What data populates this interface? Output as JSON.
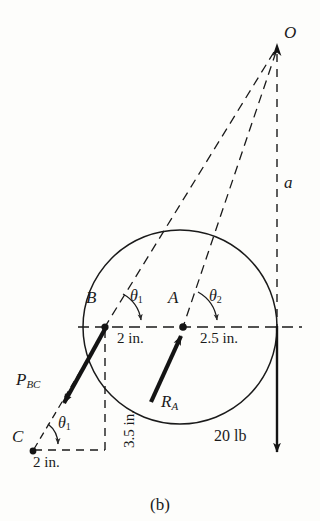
{
  "figure": {
    "caption": "(b)",
    "type": "free-body-diagram",
    "background_color": "#fdfdfb",
    "line_color": "#1a1a1a"
  },
  "points": [
    {
      "id": "O",
      "label": "O",
      "x": 277,
      "y": 45,
      "label_x": 285,
      "label_y": 33
    },
    {
      "id": "A",
      "label": "A",
      "x": 183,
      "y": 327,
      "label_x": 170,
      "label_y": 300
    },
    {
      "id": "B",
      "label": "B",
      "x": 105,
      "y": 327,
      "label_x": 88,
      "label_y": 300
    },
    {
      "id": "C",
      "label": "C",
      "x": 32,
      "y": 450,
      "label_x": 14,
      "label_y": 430
    }
  ],
  "circle": {
    "center_x": 180,
    "center_y": 327,
    "radius": 97
  },
  "angles": [
    {
      "id": "theta1_top",
      "label": "θ",
      "sub": "1",
      "label_x": 132,
      "label_y": 291
    },
    {
      "id": "theta2_top",
      "label": "θ",
      "sub": "2",
      "label_x": 210,
      "label_y": 291
    },
    {
      "id": "theta1_bottom",
      "label": "θ",
      "sub": "1",
      "label_x": 60,
      "label_y": 419
    }
  ],
  "dimensions": [
    {
      "id": "dim-ab",
      "label": "2 in.",
      "x": 124,
      "y": 334,
      "rotated": false
    },
    {
      "id": "dim-a-right",
      "label": "2.5 in.",
      "x": 204,
      "y": 334,
      "rotated": false
    },
    {
      "id": "dim-bc-vert",
      "label": "3.5 in.",
      "x": 118,
      "y": 440,
      "rotated": true
    },
    {
      "id": "dim-bottom",
      "label": "2 in.",
      "x": 36,
      "y": 456,
      "rotated": false
    }
  ],
  "forces": [
    {
      "id": "P_BC",
      "label": "P",
      "sub": "BC",
      "label_x": 18,
      "label_y": 372,
      "value": null
    },
    {
      "id": "R_A",
      "label": "R",
      "sub": "A",
      "label_x": 163,
      "label_y": 396,
      "value": null
    },
    {
      "id": "W",
      "label": "20 lb",
      "sub": "",
      "label_x": 216,
      "label_y": 435,
      "value": "20 lb"
    }
  ],
  "distances": [
    {
      "id": "a",
      "label": "a",
      "label_x": 285,
      "label_y": 178
    }
  ],
  "lines": {
    "centerline": {
      "x1": 80,
      "y1": 327,
      "x2": 300,
      "y2": 327,
      "style": "dashed"
    },
    "vertical_from_O": {
      "x1": 277,
      "y1": 52,
      "x2": 277,
      "y2": 327,
      "style": "dashed"
    },
    "O_to_B": {
      "x1": 277,
      "y1": 50,
      "x2": 105,
      "y2": 327,
      "style": "dashed"
    },
    "O_to_A": {
      "x1": 277,
      "y1": 50,
      "x2": 183,
      "y2": 327,
      "style": "dashed"
    },
    "B_vertical_drop": {
      "x1": 105,
      "y1": 327,
      "x2": 105,
      "y2": 450,
      "style": "dashed"
    },
    "C_horizontal": {
      "x1": 32,
      "y1": 450,
      "x2": 105,
      "y2": 450,
      "style": "dashed"
    },
    "C_to_B_line": {
      "x1": 32,
      "y1": 450,
      "x2": 105,
      "y2": 327,
      "style": "dashed"
    },
    "weight_arrow": {
      "x1": 277,
      "y1": 327,
      "x2": 277,
      "y2": 458,
      "style": "solid-arrow-down"
    },
    "P_BC_arrow": {
      "x1": 105,
      "y1": 328,
      "x2": 60,
      "y2": 408,
      "style": "solid-arrow"
    },
    "R_A_arrow": {
      "x1": 152,
      "y1": 400,
      "x2": 183,
      "y2": 330,
      "style": "solid-arrow"
    },
    "O_arrowhead": {
      "x": 277,
      "y": 45,
      "direction": "up"
    }
  }
}
